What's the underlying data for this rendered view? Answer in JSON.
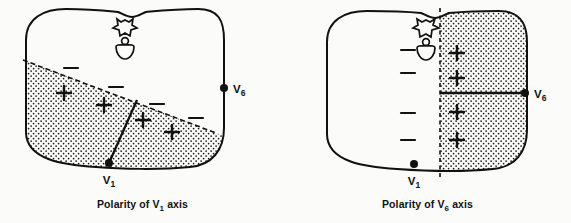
{
  "figure": {
    "type": "anatomical-diagram",
    "background_color": "#fbfbfa",
    "ink_color": "#111111",
    "stipple_color": "#1a1a1a"
  },
  "panels": [
    {
      "id": "v1",
      "caption_prefix": "Polarity of V",
      "caption_subscript": "1",
      "caption_suffix": " axis",
      "caption_full": "Polarity of V1 axis",
      "divider": {
        "kind": "diagonal-dashed-boundary",
        "description": "Diagonal line from left border down to right border separating negative (upper) from positive (lower, stippled) half",
        "x1": 23,
        "y1": 60,
        "x2": 216,
        "y2": 133
      },
      "septum_line": {
        "kind": "solid-septum-line",
        "description": "Interventricular septum line from V1 electrode up-right to the diagonal boundary",
        "x1": 109,
        "y1": 163,
        "x2": 137,
        "y2": 100
      },
      "positive_region": "lower-left stippled sector below diagonal",
      "negative_region": "upper-right clear sector above diagonal",
      "plus_signs": [
        {
          "x": 64,
          "y": 93
        },
        {
          "x": 104,
          "y": 105
        },
        {
          "x": 143,
          "y": 120
        },
        {
          "x": 172,
          "y": 132
        }
      ],
      "minus_signs": [
        {
          "x": 71,
          "y": 68
        },
        {
          "x": 116,
          "y": 87
        },
        {
          "x": 157,
          "y": 104
        },
        {
          "x": 196,
          "y": 118
        }
      ],
      "electrodes": [
        {
          "label_prefix": "V",
          "label_subscript": "1",
          "label": "V1",
          "x": 109,
          "y": 163,
          "label_x": 109,
          "label_y": 182,
          "label_anchor": "middle"
        },
        {
          "label_prefix": "V",
          "label_subscript": "6",
          "label": "V6",
          "x": 224,
          "y": 88,
          "label_x": 232,
          "label_y": 92,
          "label_anchor": "start"
        }
      ],
      "vertebra": {
        "x": 125,
        "y": 18,
        "description": "spinous process, spinal canal, vertebral body"
      }
    },
    {
      "id": "v6",
      "caption_prefix": "Polarity of V",
      "caption_subscript": "6",
      "caption_suffix": " axis",
      "caption_full": "Polarity of V6 axis",
      "divider": {
        "kind": "vertical-dashed-boundary",
        "description": "Vertical dashed line separating negative (left) from positive (right, stippled) half",
        "x1": 155,
        "y1": 8,
        "x2": 155,
        "y2": 178
      },
      "axis_line": {
        "kind": "solid-horizontal-axis",
        "description": "Horizontal V6 lead axis from dashed midline to the V6 electrode",
        "x1": 155,
        "y1": 93,
        "x2": 240,
        "y2": 93
      },
      "positive_region": "right stippled half",
      "negative_region": "left clear half",
      "plus_signs": [
        {
          "x": 172,
          "y": 53
        },
        {
          "x": 172,
          "y": 78
        },
        {
          "x": 172,
          "y": 112
        },
        {
          "x": 172,
          "y": 140
        }
      ],
      "minus_signs": [
        {
          "x": 123,
          "y": 50
        },
        {
          "x": 123,
          "y": 73
        },
        {
          "x": 123,
          "y": 113
        },
        {
          "x": 123,
          "y": 140
        }
      ],
      "electrodes": [
        {
          "label_prefix": "V",
          "label_subscript": "1",
          "label": "V1",
          "x": 129,
          "y": 164,
          "label_x": 129,
          "label_y": 183,
          "label_anchor": "middle"
        },
        {
          "label_prefix": "V",
          "label_subscript": "6",
          "label": "V6",
          "x": 240,
          "y": 93,
          "label_x": 248,
          "label_y": 97,
          "label_anchor": "start"
        }
      ],
      "vertebra": {
        "x": 141,
        "y": 18,
        "description": "spinous process, spinal canal, vertebral body straddling midline"
      }
    }
  ]
}
